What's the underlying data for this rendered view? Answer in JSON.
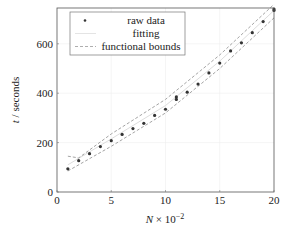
{
  "chart_data": {
    "type": "scatter",
    "title": "",
    "xlabel": "N × 10^-2",
    "xlabel_parts": {
      "var": "N",
      "mid": " × 10",
      "exp": "−2"
    },
    "ylabel": "t / seconds",
    "ylabel_parts": {
      "var": "t",
      "sep": " / ",
      "unit": "seconds"
    },
    "xlim": [
      0,
      20
    ],
    "ylim": [
      0,
      745
    ],
    "xticks": [
      0,
      5,
      10,
      15,
      20
    ],
    "yticks": [
      0,
      200,
      400,
      600
    ],
    "grid": true,
    "legend_position": "upper left",
    "legend": [
      {
        "label": "raw data",
        "style": "marker"
      },
      {
        "label": "fitting",
        "style": "solid-light"
      },
      {
        "label": "functional bounds",
        "style": "dashed"
      }
    ],
    "series": [
      {
        "name": "raw data",
        "x": [
          1,
          2,
          3,
          4,
          5,
          6,
          7,
          8,
          9,
          10,
          11,
          11,
          12,
          13,
          14,
          15,
          16,
          17,
          18,
          19,
          20,
          20
        ],
        "y": [
          94,
          127,
          155,
          184,
          208,
          233,
          257,
          278,
          310,
          335,
          375,
          385,
          404,
          437,
          482,
          522,
          571,
          604,
          645,
          690,
          735,
          745
        ]
      },
      {
        "name": "fitting",
        "x": [
          1,
          5,
          10,
          15,
          20
        ],
        "y": [
          110,
          215,
          350,
          530,
          735
        ]
      },
      {
        "name": "functional bounds (upper)",
        "x": [
          1,
          2,
          5,
          10,
          15,
          20
        ],
        "y": [
          145,
          138,
          235,
          375,
          555,
          760
        ]
      },
      {
        "name": "functional bounds (lower)",
        "x": [
          1,
          5,
          10,
          15,
          20
        ],
        "y": [
          85,
          185,
          320,
          500,
          705
        ]
      }
    ]
  }
}
